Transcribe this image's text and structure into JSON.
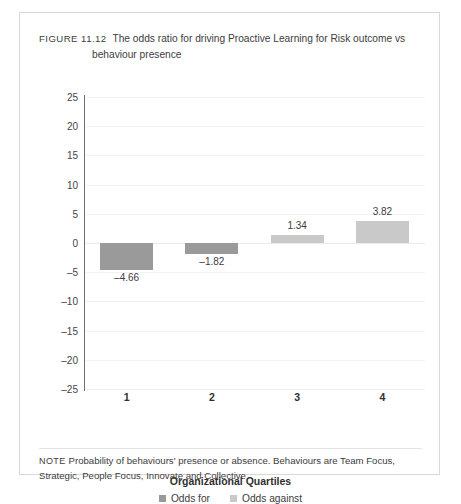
{
  "figure": {
    "label": "FIGURE 11.12",
    "caption_line1": "The odds ratio for driving Proactive Learning for Risk outcome vs",
    "caption_line2": "behaviour presence"
  },
  "note": {
    "label": "NOTE",
    "line1": "Probability of behaviours' presence or absence. Behaviours are Team Focus, Strategic,",
    "line2": "People Focus, Innovate and Collective"
  },
  "colors": {
    "odds_for": "#9a9a9a",
    "odds_against": "#c9c9c9",
    "axis": "#6f6f6f",
    "gridline": "#f2f2f2",
    "card_border": "#d8d8d8",
    "text": "#3d3d3d"
  },
  "chart_data": {
    "type": "bar",
    "title": "The odds ratio for driving Proactive Learning for Risk outcome vs behaviour presence",
    "xlabel": "Organizational Quartiles",
    "ylabel": "",
    "categories": [
      "1",
      "2",
      "3",
      "4"
    ],
    "values": [
      -4.66,
      -1.82,
      1.34,
      3.82
    ],
    "value_labels": [
      "–4.66",
      "–1.82",
      "1.34",
      "3.82"
    ],
    "series_of": [
      "Odds for",
      "Odds for",
      "Odds against",
      "Odds against"
    ],
    "ylim": [
      -25,
      25
    ],
    "yticks": [
      25,
      20,
      15,
      10,
      5,
      0,
      -5,
      -10,
      -15,
      -20,
      -25
    ],
    "ytick_labels": [
      "25",
      "20",
      "15",
      "10",
      "5",
      "0",
      "–5",
      "–10",
      "–15",
      "–20",
      "–25"
    ],
    "grid": true,
    "legend": {
      "position": "bottom",
      "entries": [
        {
          "label": "Odds for",
          "color": "#9a9a9a"
        },
        {
          "label": "Odds against",
          "color": "#c9c9c9"
        }
      ]
    }
  }
}
